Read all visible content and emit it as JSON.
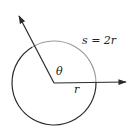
{
  "diagram": {
    "labels": {
      "arc_length": "s = 2r",
      "angle": "θ",
      "radius": "r"
    },
    "colors": {
      "line": "#2b2b2b",
      "arc_highlight": "#9a9a9a",
      "background": "#ffffff"
    },
    "geometry": {
      "center": [
        54,
        83
      ],
      "radius": 42,
      "ray_initial_tip": [
        127,
        82
      ],
      "ray_terminal_tip": [
        18,
        14
      ]
    }
  }
}
